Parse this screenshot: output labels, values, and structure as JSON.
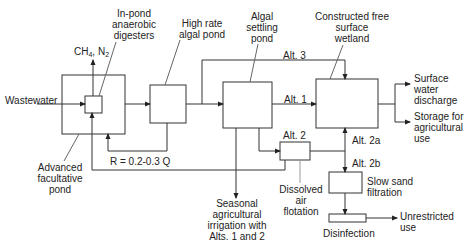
{
  "diagram": {
    "type": "process-flow",
    "nodes": {
      "wastewater": "Wastewater",
      "gas_output": {
        "ch": "CH",
        "sub1": "4",
        "mid": ", N",
        "sub2": "2"
      },
      "in_pond_digesters": [
        "In-pond",
        "anaerobic",
        "digesters"
      ],
      "advanced_facultative_pond": [
        "Advanced",
        "facultative",
        "pond"
      ],
      "high_rate_algal_pond": [
        "High rate",
        "algal pond"
      ],
      "algal_settling_pond": [
        "Algal",
        "settling",
        "pond"
      ],
      "constructed_wetland": [
        "Constructed free",
        "surface",
        "wetland"
      ],
      "surface_water_discharge": [
        "Surface",
        "water",
        "discharge"
      ],
      "storage_agricultural": [
        "Storage for",
        "agricultural",
        "use"
      ],
      "dissolved_air_flotation": [
        "Dissolved",
        "air",
        "flotation"
      ],
      "seasonal_irrigation": [
        "Seasonal",
        "agricultural",
        "irrigation with",
        "Alts. 1 and 2"
      ],
      "slow_sand_filtration": [
        "Slow sand",
        "filtration"
      ],
      "disinfection": "Disinfection",
      "unrestricted_use": [
        "Unrestricted",
        "use"
      ]
    },
    "edge_labels": {
      "alt1": "Alt. 1",
      "alt2": "Alt. 2",
      "alt2a": "Alt. 2a",
      "alt2b": "Alt. 2b",
      "alt3": "Alt. 3",
      "recycle": "R = 0.2-0.3 Q"
    }
  }
}
